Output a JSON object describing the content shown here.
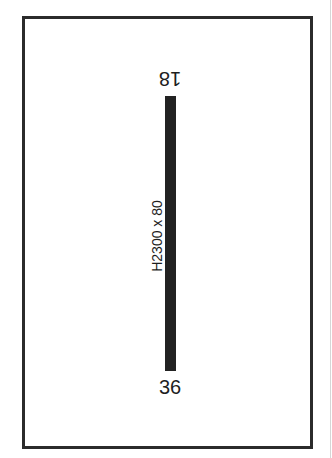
{
  "diagram": {
    "type": "airport-runway-diagram",
    "runway": {
      "end_north_label": "18",
      "end_south_label": "36",
      "dimensions_label": "H2300 x 80",
      "color": "#222222"
    },
    "frame": {
      "border_color": "#2b2b2b"
    }
  }
}
